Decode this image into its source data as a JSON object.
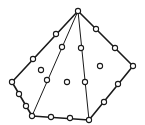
{
  "diagram": {
    "type": "finite-element-mesh",
    "colors": {
      "stroke": "#1a1a1a",
      "background": "#ffffff",
      "node_fill": "#ffffff"
    },
    "outline": [
      [
        78,
        11
      ],
      [
        133,
        66
      ],
      [
        89,
        120
      ],
      [
        32,
        116
      ],
      [
        12,
        82
      ]
    ],
    "outer_edge_width": 1.6,
    "inner_edge_width": 1.0,
    "inner_lines": [
      [
        [
          78,
          11
        ],
        [
          32,
          116
        ]
      ],
      [
        [
          78,
          11
        ],
        [
          89,
          120
        ]
      ]
    ],
    "nodes": {
      "vertices": [
        [
          78,
          11
        ],
        [
          133,
          66
        ],
        [
          89,
          120
        ],
        [
          32,
          116
        ],
        [
          12,
          82
        ]
      ],
      "boundary": [
        [
          56,
          34
        ],
        [
          33,
          59
        ],
        [
          96,
          29
        ],
        [
          115,
          48
        ],
        [
          118,
          84
        ],
        [
          104,
          102
        ],
        [
          70,
          118
        ],
        [
          51,
          117
        ],
        [
          26,
          106
        ],
        [
          19,
          94
        ]
      ],
      "inner_line": [
        [
          62,
          47
        ],
        [
          47,
          80
        ],
        [
          81,
          48
        ],
        [
          85,
          82
        ]
      ],
      "interior": [
        [
          41,
          70
        ],
        [
          67,
          82
        ],
        [
          100,
          66
        ]
      ]
    },
    "node_radius": 2.6
  }
}
